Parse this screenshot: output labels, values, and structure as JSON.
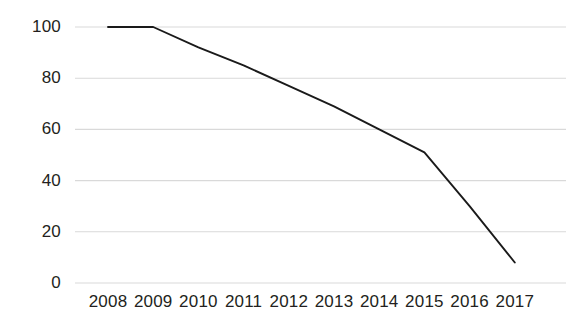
{
  "chart_data": {
    "type": "line",
    "title": "",
    "subtitle": "",
    "xlabel": "",
    "ylabel": "",
    "categories": [
      "2008",
      "2009",
      "2010",
      "2011",
      "2012",
      "2013",
      "2014",
      "2015",
      "2016",
      "2017"
    ],
    "x": [
      2008,
      2009,
      2010,
      2011,
      2012,
      2013,
      2014,
      2015,
      2016,
      2017
    ],
    "values": [
      100,
      100,
      92,
      85,
      77,
      69,
      60,
      51,
      30,
      8
    ],
    "series": [
      {
        "name": "",
        "values": [
          100,
          100,
          92,
          85,
          77,
          69,
          60,
          51,
          30,
          8
        ]
      }
    ],
    "ylim": [
      0,
      100
    ],
    "yticks": [
      0,
      20,
      40,
      60,
      80,
      100
    ],
    "ytick_labels": [
      "0",
      "20",
      "40",
      "60",
      "80",
      "100"
    ],
    "xtick_labels": [
      "2008",
      "2009",
      "2010",
      "2011",
      "2012",
      "2013",
      "2014",
      "2015",
      "2016",
      "2017"
    ],
    "grid": "horizontal",
    "legend": "none",
    "line_color": "#1a1a1a",
    "grid_color": "#d9d9d9",
    "text_color": "#231f20",
    "background": "#ffffff",
    "annotations": []
  },
  "axis": {
    "y_labels": [
      "100",
      "80",
      "60",
      "40",
      "20",
      "0"
    ],
    "x_labels": [
      "2008",
      "2009",
      "2010",
      "2011",
      "2012",
      "2013",
      "2014",
      "2015",
      "2016",
      "2017"
    ]
  }
}
